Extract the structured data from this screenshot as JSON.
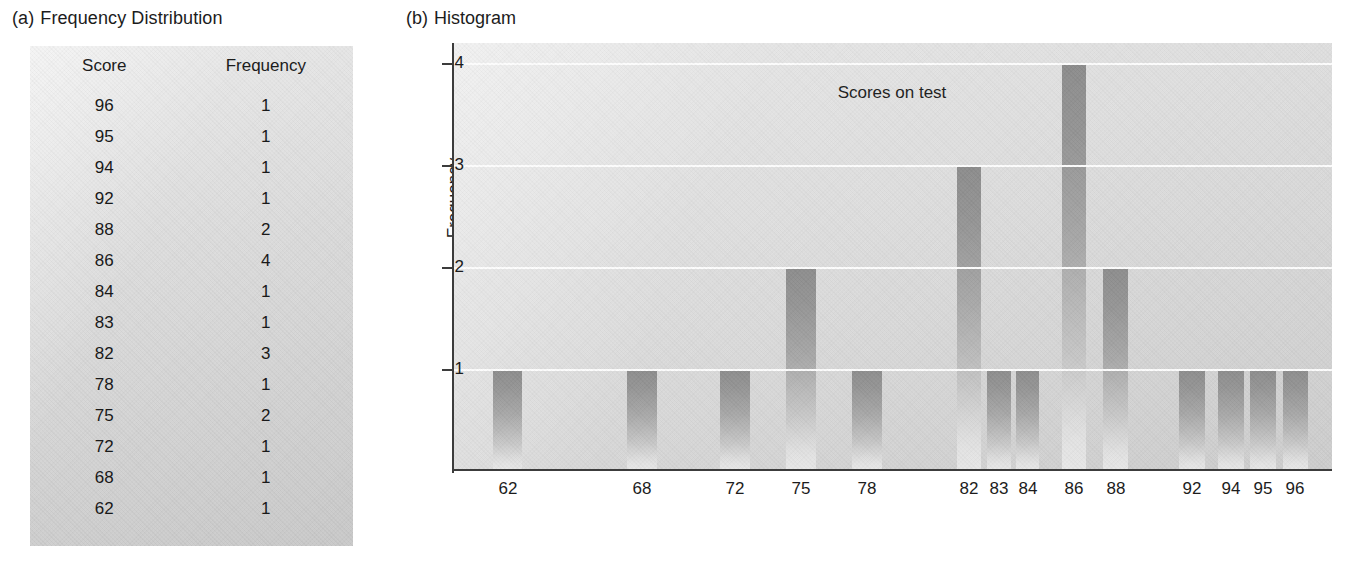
{
  "panel_a": {
    "caption_letter": "(a)",
    "caption_text": "Frequency Distribution",
    "table": {
      "headers": [
        "Score",
        "Frequency"
      ],
      "rows": [
        [
          "96",
          "1"
        ],
        [
          "95",
          "1"
        ],
        [
          "94",
          "1"
        ],
        [
          "92",
          "1"
        ],
        [
          "88",
          "2"
        ],
        [
          "86",
          "4"
        ],
        [
          "84",
          "1"
        ],
        [
          "83",
          "1"
        ],
        [
          "82",
          "3"
        ],
        [
          "78",
          "1"
        ],
        [
          "75",
          "2"
        ],
        [
          "72",
          "1"
        ],
        [
          "68",
          "1"
        ],
        [
          "62",
          "1"
        ]
      ]
    }
  },
  "panel_b": {
    "caption_letter": "(b)",
    "caption_text": "Histogram"
  },
  "chart_data": {
    "type": "bar",
    "title": "Histogram",
    "xlabel": "Scores on test",
    "ylabel": "Frequency",
    "categories": [
      "62",
      "68",
      "72",
      "75",
      "78",
      "82",
      "83",
      "84",
      "86",
      "88",
      "92",
      "94",
      "95",
      "96"
    ],
    "values": [
      1,
      1,
      1,
      2,
      1,
      3,
      1,
      1,
      4,
      2,
      1,
      1,
      1,
      1
    ],
    "yticks": [
      "1",
      "2",
      "3",
      "4"
    ],
    "ylim": [
      0,
      4.2
    ],
    "grid": true,
    "legend": "none",
    "colors": {
      "bar_top": "#8c8c8c",
      "bar_bottom": "#e8e8e8",
      "plot_background": "#dddddd",
      "gridline": "#fdfdfd",
      "axis": "#3c3c3c",
      "text": "#1c1c1c",
      "panel_background": "#dedede"
    }
  }
}
